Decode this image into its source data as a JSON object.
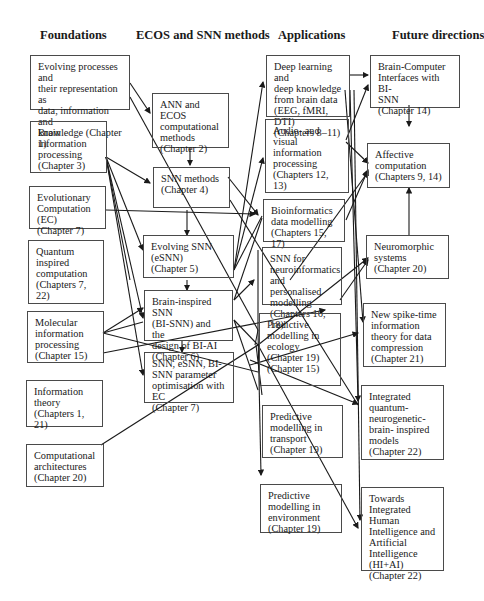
{
  "headers": {
    "foundations": "Foundations",
    "methods": "ECOS and SNN methods",
    "applications": "Applications",
    "future": "Future directions"
  },
  "foundations": [
    {
      "lines": [
        "Evolving processes and",
        "their representation as",
        "data, information and",
        "knowledge (Chapter 1)"
      ]
    },
    {
      "lines": [
        "Brain",
        "information",
        "processing",
        "(Chapter 3)"
      ]
    },
    {
      "lines": [
        "Evolutionary",
        "Computation (EC)",
        "(Chapter 7)"
      ]
    },
    {
      "lines": [
        "Quantum",
        "inspired",
        "computation",
        "(Chapters 7, 22)"
      ]
    },
    {
      "lines": [
        "Molecular",
        "information",
        "processing",
        "(Chapter 15)"
      ]
    },
    {
      "lines": [
        "Information",
        "theory",
        "(Chapters 1, 21)"
      ]
    },
    {
      "lines": [
        "Computational",
        "architectures",
        "(Chapter 20)"
      ]
    }
  ],
  "methods": [
    {
      "lines": [
        "ANN and ECOS",
        "computational",
        "methods",
        "(Chapter 2)"
      ]
    },
    {
      "lines": [
        "SNN methods",
        "(Chapter 4)"
      ]
    },
    {
      "lines": [
        "Evolving SNN",
        "(eSNN)",
        "(Chapter 5)"
      ]
    },
    {
      "lines": [
        "Brain-inspired SNN",
        "(BI-SNN) and the",
        "design of BI-AI",
        "(Chapter 6)"
      ]
    },
    {
      "lines": [
        "SNN, eSNN, BI-",
        "SNN parameter",
        "optimisation with EC",
        "(Chapter 7)"
      ]
    }
  ],
  "applications": [
    {
      "lines": [
        "Deep learning and",
        "deep knowledge",
        "from brain data",
        "(EEG, fMRI, DTI)",
        "(Chapters 8–11)"
      ]
    },
    {
      "lines": [
        "Audio- and visual",
        "information",
        "processing",
        "(Chapters 12, 13)"
      ]
    },
    {
      "lines": [
        "Bioinformatics",
        "data modelling",
        "(Chapters 15, 17)"
      ]
    },
    {
      "lines": [
        "SNN for",
        "neuroinformatics",
        "and personalised",
        "modelling",
        "(Chapters 16, 18)"
      ]
    },
    {
      "lines": [
        "Predictive",
        "modelling in",
        "ecology",
        "(Chapter 19)",
        "(Chapter 15)"
      ]
    },
    {
      "lines": [
        "Predictive",
        "modelling in",
        "transport",
        "(Chapter 19)"
      ]
    },
    {
      "lines": [
        "Predictive",
        "modelling in",
        "environment",
        "(Chapter 19)"
      ]
    }
  ],
  "future": [
    {
      "lines": [
        "Brain-Computer",
        "Interfaces with BI-",
        "SNN",
        "(Chapter 14)"
      ]
    },
    {
      "lines": [
        "Affective",
        "computation",
        "(Chapters 9, 14)"
      ]
    },
    {
      "lines": [
        "Neuromorphic",
        "systems",
        "(Chapter 20)"
      ]
    },
    {
      "lines": [
        "New spike-time",
        "information",
        "theory for data",
        "compression",
        "(Chapter 21)"
      ]
    },
    {
      "lines": [
        "Integrated",
        "quantum-",
        "neurogenetic-",
        "brain- inspired",
        "models",
        "(Chapter 22)"
      ]
    },
    {
      "lines": [
        "Towards",
        "Integrated Human",
        "Intelligence and",
        "Artificial",
        "Intelligence",
        "(HI+AI)",
        "(Chapter 22)"
      ]
    }
  ]
}
